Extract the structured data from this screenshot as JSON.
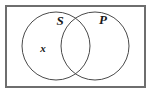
{
  "diagram": {
    "type": "venn-diagram",
    "background_color": "#ffffff",
    "universe": {
      "label": "",
      "shape": "rectangle",
      "x": 5,
      "y": 5,
      "width": 141,
      "height": 83,
      "stroke_color": "#6e6e6e",
      "stroke_width": 2,
      "fill": "#ffffff"
    },
    "circles": [
      {
        "label": "S",
        "name": "set-s",
        "cx": 56,
        "cy": 46,
        "r": 34,
        "stroke_color": "#4a4a4a",
        "stroke_width": 1,
        "fill": "none",
        "label_x": 60,
        "label_y": 22
      },
      {
        "label": "P",
        "name": "set-p",
        "cx": 95,
        "cy": 46,
        "r": 34,
        "stroke_color": "#4a4a4a",
        "stroke_width": 1,
        "fill": "none",
        "label_x": 103,
        "label_y": 21
      }
    ],
    "markers": [
      {
        "label": "x",
        "name": "element-x",
        "region": "S-only",
        "x": 43,
        "y": 49,
        "color": "#1a1a1a"
      }
    ]
  }
}
